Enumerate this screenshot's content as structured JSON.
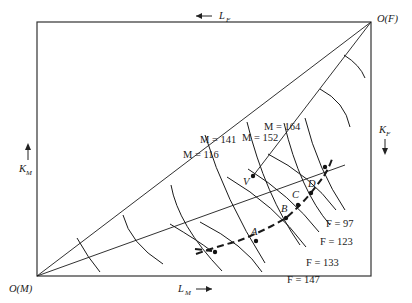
{
  "diagram": {
    "type": "edgeworth-box",
    "origins": {
      "bottom_left": "O(M)",
      "top_right": "O(F)"
    },
    "axes": {
      "bottom": {
        "label": "L",
        "sub": "M",
        "arrow": "→"
      },
      "top": {
        "label": "L",
        "sub": "F",
        "arrow": "←"
      },
      "left": {
        "label": "K",
        "sub": "M",
        "arrow": "↑"
      },
      "right": {
        "label": "K",
        "sub": "F",
        "arrow": "↓"
      }
    },
    "isoquants_M": [
      {
        "label": "M = 116"
      },
      {
        "label": "M = 141"
      },
      {
        "label": "M = 152"
      },
      {
        "label": "M = 164"
      }
    ],
    "isoquants_F": [
      {
        "label": "F = 97"
      },
      {
        "label": "F = 123"
      },
      {
        "label": "F = 133"
      },
      {
        "label": "F = 147"
      }
    ],
    "points": [
      {
        "label": "A"
      },
      {
        "label": "B"
      },
      {
        "label": "C"
      },
      {
        "label": "D"
      },
      {
        "label": "V"
      }
    ]
  }
}
